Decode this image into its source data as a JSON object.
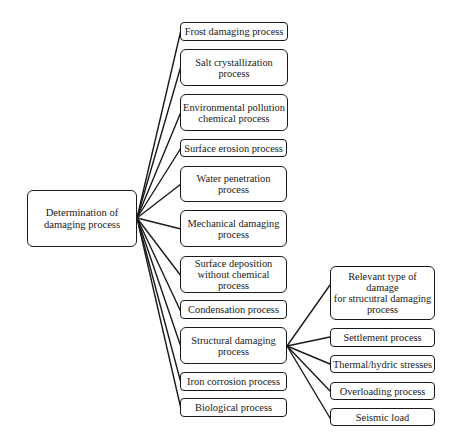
{
  "diagram": {
    "type": "tree",
    "root": {
      "label": "Determination of damaging process",
      "lines": [
        "Determination of",
        "damaging process"
      ]
    },
    "children": [
      {
        "id": "frost",
        "lines": [
          "Frost damaging process"
        ]
      },
      {
        "id": "salt",
        "lines": [
          "Salt crystallization",
          "process"
        ]
      },
      {
        "id": "environmental",
        "lines": [
          "Environmental pollution",
          "chemical process"
        ]
      },
      {
        "id": "erosion",
        "lines": [
          "Surface erosion process"
        ]
      },
      {
        "id": "water",
        "lines": [
          "Water penetration process"
        ]
      },
      {
        "id": "mechanical",
        "lines": [
          "Mechanical damaging",
          "process"
        ]
      },
      {
        "id": "deposition",
        "lines": [
          "Surface deposition",
          "without chemical process"
        ]
      },
      {
        "id": "condensation",
        "lines": [
          "Condensation process"
        ]
      },
      {
        "id": "structural",
        "lines": [
          "Structural damaging",
          "process"
        ]
      },
      {
        "id": "iron",
        "lines": [
          "Iron corrosion process"
        ]
      },
      {
        "id": "biological",
        "lines": [
          "Biological process"
        ]
      }
    ],
    "structural_children": [
      {
        "id": "relevant",
        "lines": [
          "Relevant type of damage",
          "for strucutral damaging",
          "process"
        ]
      },
      {
        "id": "settlement",
        "lines": [
          "Settlement process"
        ]
      },
      {
        "id": "thermal",
        "lines": [
          "Thermal/hydric stresses"
        ]
      },
      {
        "id": "overloading",
        "lines": [
          "Overloading process"
        ]
      },
      {
        "id": "seismic",
        "lines": [
          "Seismic load"
        ]
      }
    ],
    "colors": {
      "stroke": "#1a1a1a",
      "background": "#ffffff",
      "text": "#1a1a1a"
    }
  }
}
